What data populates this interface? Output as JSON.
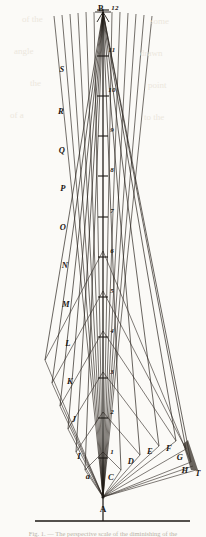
{
  "figure": {
    "apex_label": "A",
    "top_label": "B",
    "top_number": "12",
    "baseline_right_label": "T",
    "background_color": "#fbfaf7",
    "ink_color": "#1b1713"
  },
  "scale_marks": [
    {
      "number": "12",
      "y": 10
    },
    {
      "number": "11",
      "y": 50
    },
    {
      "number": "10",
      "y": 90
    },
    {
      "number": "9",
      "y": 130
    },
    {
      "number": "8",
      "y": 170
    },
    {
      "number": "7",
      "y": 211
    },
    {
      "number": "6",
      "y": 251
    },
    {
      "number": "5",
      "y": 291
    },
    {
      "number": "4",
      "y": 331
    },
    {
      "number": "3",
      "y": 372
    },
    {
      "number": "2",
      "y": 412
    },
    {
      "number": "1",
      "y": 452
    }
  ],
  "left_labels": [
    {
      "text": "S",
      "x": 62,
      "y": 69
    },
    {
      "text": "R",
      "x": 61,
      "y": 111
    },
    {
      "text": "Q",
      "x": 62,
      "y": 150
    },
    {
      "text": "P",
      "x": 63,
      "y": 188
    },
    {
      "text": "O",
      "x": 63,
      "y": 227
    },
    {
      "text": "N",
      "x": 65,
      "y": 265
    },
    {
      "text": "M",
      "x": 66,
      "y": 304
    },
    {
      "text": "L",
      "x": 68,
      "y": 343
    },
    {
      "text": "K",
      "x": 70,
      "y": 381
    },
    {
      "text": "J",
      "x": 74,
      "y": 419
    },
    {
      "text": "I",
      "x": 79,
      "y": 456
    },
    {
      "text": "a",
      "x": 88,
      "y": 476
    }
  ],
  "right_labels": [
    {
      "text": "C",
      "x": 111,
      "y": 477
    },
    {
      "text": "D",
      "x": 131,
      "y": 461
    },
    {
      "text": "E",
      "x": 150,
      "y": 451
    },
    {
      "text": "F",
      "x": 169,
      "y": 448
    },
    {
      "text": "G",
      "x": 180,
      "y": 457
    },
    {
      "text": "H",
      "x": 185,
      "y": 470
    },
    {
      "text": "T",
      "x": 198,
      "y": 473
    }
  ],
  "caption": {
    "text": "Fig. 1. — The perspective scale of the diminishing of the"
  },
  "ghost_lines": [
    {
      "text": "of the",
      "x": 22,
      "y": 14
    },
    {
      "text": "some",
      "x": 150,
      "y": 16
    },
    {
      "text": "angle",
      "x": 14,
      "y": 46
    },
    {
      "text": "drawn",
      "x": 140,
      "y": 48
    },
    {
      "text": "the",
      "x": 30,
      "y": 78
    },
    {
      "text": "point",
      "x": 148,
      "y": 80
    },
    {
      "text": "of a",
      "x": 10,
      "y": 110
    },
    {
      "text": "to the",
      "x": 144,
      "y": 112
    }
  ]
}
